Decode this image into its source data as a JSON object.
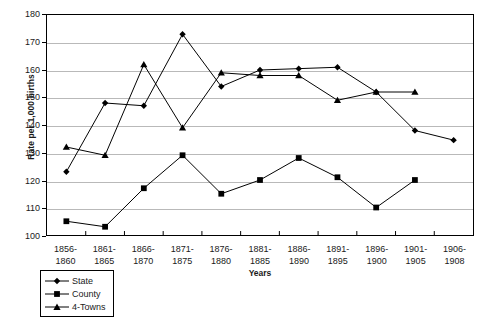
{
  "chart_data": {
    "type": "line",
    "title": "",
    "xlabel": "Years",
    "ylabel": "Rate per 1,000 births",
    "ylim": [
      100,
      180
    ],
    "ytick_step": 10,
    "yticks": [
      100,
      110,
      120,
      130,
      140,
      150,
      160,
      170,
      180
    ],
    "grid": true,
    "legend_position": "below-left",
    "categories": [
      "1856-1860",
      "1861-1865",
      "1866-1870",
      "1871-1875",
      "1876-1880",
      "1881-1885",
      "1886-1890",
      "1891-1895",
      "1896-1900",
      "1901-1905",
      "1906-1908"
    ],
    "category_lines": [
      [
        "1856-",
        "1860"
      ],
      [
        "1861-",
        "1865"
      ],
      [
        "1866-",
        "1870"
      ],
      [
        "1871-",
        "1875"
      ],
      [
        "1876-",
        "1880"
      ],
      [
        "1881-",
        "1885"
      ],
      [
        "1886-",
        "1890"
      ],
      [
        "1891-",
        "1895"
      ],
      [
        "1896-",
        "1900"
      ],
      [
        "1901-",
        "1905"
      ],
      [
        "1906-",
        "1908"
      ]
    ],
    "series": [
      {
        "name": "State",
        "marker": "diamond",
        "color": "#000000",
        "values": [
          123,
          148,
          147,
          173,
          154,
          160,
          160.5,
          161,
          152,
          138,
          134.5
        ]
      },
      {
        "name": "County",
        "marker": "square",
        "color": "#000000",
        "values": [
          105,
          103,
          117,
          129,
          115,
          120,
          128,
          121,
          110,
          120,
          null
        ]
      },
      {
        "name": "4-Towns",
        "marker": "triangle",
        "color": "#000000",
        "values": [
          132,
          129,
          162,
          139,
          159,
          158,
          158,
          149,
          152,
          152,
          null
        ]
      }
    ]
  },
  "axis": {
    "y_title": "Rate per 1,000 births",
    "x_title": "Years",
    "y_tick_labels": [
      "180",
      "170",
      "160",
      "150",
      "140",
      "130",
      "120",
      "110",
      "100"
    ]
  },
  "legend": {
    "items": [
      {
        "label": "State",
        "marker": "diamond"
      },
      {
        "label": "County",
        "marker": "square"
      },
      {
        "label": "4-Towns",
        "marker": "triangle"
      }
    ]
  },
  "colors": {
    "ink": "#000000",
    "grid": "#b9b9b9",
    "background": "#ffffff"
  }
}
